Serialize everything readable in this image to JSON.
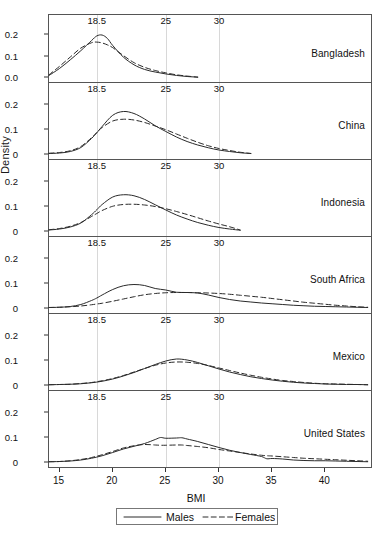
{
  "figure": {
    "ylabel": "Density",
    "xlabel": "BMI"
  },
  "legend": {
    "males_label": "Males",
    "females_label": "Females"
  },
  "chart_data": {
    "type": "line",
    "title": "",
    "xlabel": "BMI",
    "ylabel": "Density",
    "xlim": [
      14,
      44.5
    ],
    "ylim": [
      0,
      0.22
    ],
    "grid": "vertical reference lines at BMI 18.5, 25, 30 (labeled at top of each panel)",
    "legend_position": "bottom-center, boxed",
    "xticks": [
      15,
      20,
      25,
      30,
      35,
      40
    ],
    "xtick_labels": [
      "15",
      "20",
      "25",
      "30",
      "35",
      "40"
    ],
    "reference_lines": [
      18.5,
      25,
      30
    ],
    "reference_line_labels": [
      "18.5",
      "25",
      "30"
    ],
    "series_names": [
      "Males",
      "Females"
    ],
    "series_styles": [
      "solid",
      "dashed"
    ],
    "panels": [
      {
        "name": "Bangladesh",
        "yticks": [
          0,
          0.1,
          0.2
        ],
        "ytick_labels": [
          "0.0",
          "0.1",
          "0.2"
        ],
        "x": [
          14,
          15,
          16,
          17,
          18,
          18.5,
          19,
          19.5,
          20,
          21,
          22,
          23,
          24,
          25,
          26,
          27,
          28
        ],
        "series": [
          {
            "name": "Males",
            "values": [
              0.012,
              0.045,
              0.085,
              0.128,
              0.175,
              0.197,
              0.201,
              0.185,
              0.152,
              0.098,
              0.062,
              0.04,
              0.028,
              0.019,
              0.012,
              0.007,
              0.004
            ]
          },
          {
            "name": "Females",
            "values": [
              0.015,
              0.055,
              0.098,
              0.14,
              0.165,
              0.168,
              0.164,
              0.155,
              0.142,
              0.105,
              0.072,
              0.05,
              0.035,
              0.024,
              0.015,
              0.009,
              0.004
            ]
          }
        ]
      },
      {
        "name": "China",
        "yticks": [
          0,
          0.1,
          0.2
        ],
        "ytick_labels": [
          "0",
          "0.1",
          "0.2"
        ],
        "x": [
          14,
          15,
          16,
          17,
          18,
          18.5,
          19,
          20,
          21,
          22,
          23,
          24,
          25,
          26,
          27,
          28,
          29,
          30,
          31,
          32,
          33
        ],
        "series": [
          {
            "name": "Males",
            "values": [
              0.002,
              0.004,
              0.01,
              0.026,
              0.062,
              0.085,
              0.11,
              0.155,
              0.17,
              0.162,
              0.14,
              0.113,
              0.09,
              0.068,
              0.05,
              0.036,
              0.025,
              0.016,
              0.01,
              0.005,
              0.002
            ]
          },
          {
            "name": "Females",
            "values": [
              0.003,
              0.006,
              0.013,
              0.03,
              0.065,
              0.086,
              0.106,
              0.132,
              0.139,
              0.136,
              0.126,
              0.112,
              0.097,
              0.08,
              0.063,
              0.047,
              0.033,
              0.022,
              0.014,
              0.007,
              0.002
            ]
          }
        ]
      },
      {
        "name": "Indonesia",
        "yticks": [
          0,
          0.1,
          0.2
        ],
        "ytick_labels": [
          "0",
          "0.1",
          "0.2"
        ],
        "x": [
          14,
          15,
          16,
          17,
          18,
          18.5,
          19,
          20,
          21,
          22,
          23,
          24,
          25,
          26,
          27,
          28,
          29,
          30,
          31,
          32
        ],
        "series": [
          {
            "name": "Males",
            "values": [
              0.004,
              0.008,
              0.016,
              0.032,
              0.065,
              0.085,
              0.106,
              0.136,
              0.145,
              0.141,
              0.126,
              0.105,
              0.084,
              0.064,
              0.048,
              0.034,
              0.023,
              0.014,
              0.008,
              0.003
            ]
          },
          {
            "name": "Females",
            "values": [
              0.005,
              0.01,
              0.019,
              0.034,
              0.058,
              0.07,
              0.082,
              0.099,
              0.106,
              0.107,
              0.104,
              0.098,
              0.089,
              0.078,
              0.066,
              0.053,
              0.04,
              0.028,
              0.017,
              0.004
            ]
          }
        ]
      },
      {
        "name": "South Africa",
        "yticks": [
          0,
          0.1,
          0.2
        ],
        "ytick_labels": [
          "0",
          "0.1",
          "0.2"
        ],
        "x": [
          14,
          15,
          16,
          17,
          18,
          18.5,
          19,
          20,
          21,
          22,
          23,
          24,
          25,
          26,
          27,
          28,
          29,
          30,
          31,
          32,
          33,
          34,
          35,
          36,
          37,
          38,
          39,
          40,
          41,
          42,
          43,
          44
        ],
        "series": [
          {
            "name": "Males",
            "values": [
              0.002,
              0.003,
              0.006,
              0.014,
              0.03,
              0.04,
              0.052,
              0.074,
              0.089,
              0.094,
              0.09,
              0.078,
              0.072,
              0.063,
              0.062,
              0.06,
              0.052,
              0.042,
              0.034,
              0.028,
              0.024,
              0.02,
              0.017,
              0.014,
              0.011,
              0.009,
              0.007,
              0.006,
              0.005,
              0.004,
              0.003,
              0.002
            ]
          },
          {
            "name": "Females",
            "values": [
              0.002,
              0.003,
              0.005,
              0.008,
              0.013,
              0.016,
              0.019,
              0.027,
              0.036,
              0.045,
              0.053,
              0.058,
              0.061,
              0.062,
              0.062,
              0.061,
              0.06,
              0.058,
              0.055,
              0.051,
              0.047,
              0.043,
              0.038,
              0.033,
              0.028,
              0.023,
              0.019,
              0.015,
              0.011,
              0.008,
              0.005,
              0.003
            ]
          }
        ]
      },
      {
        "name": "Mexico",
        "yticks": [
          0,
          0.1,
          0.2
        ],
        "ytick_labels": [
          "0",
          "0.1",
          "0.2"
        ],
        "x": [
          14,
          15,
          16,
          17,
          18,
          19,
          20,
          21,
          22,
          23,
          24,
          25,
          26,
          27,
          28,
          29,
          30,
          31,
          32,
          33,
          34,
          35,
          36,
          37,
          38,
          39,
          40,
          41,
          42,
          43,
          44
        ],
        "series": [
          {
            "name": "Males",
            "values": [
              0.001,
              0.002,
              0.003,
              0.005,
              0.009,
              0.015,
              0.024,
              0.036,
              0.05,
              0.066,
              0.082,
              0.096,
              0.104,
              0.1,
              0.09,
              0.077,
              0.064,
              0.052,
              0.042,
              0.033,
              0.026,
              0.02,
              0.015,
              0.011,
              0.008,
              0.006,
              0.004,
              0.003,
              0.002,
              0.002,
              0.001
            ]
          },
          {
            "name": "Females",
            "values": [
              0.001,
              0.002,
              0.003,
              0.006,
              0.01,
              0.017,
              0.026,
              0.038,
              0.052,
              0.066,
              0.079,
              0.088,
              0.092,
              0.091,
              0.086,
              0.078,
              0.068,
              0.058,
              0.048,
              0.039,
              0.031,
              0.024,
              0.018,
              0.014,
              0.01,
              0.007,
              0.005,
              0.004,
              0.003,
              0.002,
              0.001
            ]
          }
        ]
      },
      {
        "name": "United States",
        "yticks": [
          0,
          0.1,
          0.2
        ],
        "ytick_labels": [
          "0",
          "0.1",
          "0.2"
        ],
        "x": [
          14,
          15,
          16,
          17,
          18,
          19,
          20,
          21,
          22,
          23,
          24,
          24.5,
          25,
          26,
          26.5,
          27,
          28,
          29,
          30,
          31,
          32,
          33,
          34,
          34.5,
          35,
          36,
          37,
          38,
          39,
          40,
          41,
          42,
          43,
          44
        ],
        "series": [
          {
            "name": "Males",
            "values": [
              0.001,
              0.002,
              0.004,
              0.008,
              0.015,
              0.025,
              0.038,
              0.052,
              0.063,
              0.074,
              0.09,
              0.098,
              0.095,
              0.096,
              0.097,
              0.092,
              0.082,
              0.07,
              0.058,
              0.047,
              0.038,
              0.03,
              0.022,
              0.013,
              0.014,
              0.012,
              0.008,
              0.006,
              0.005,
              0.005,
              0.004,
              0.003,
              0.002,
              0.001
            ]
          },
          {
            "name": "Females",
            "values": [
              0.001,
              0.002,
              0.005,
              0.01,
              0.018,
              0.029,
              0.042,
              0.056,
              0.065,
              0.07,
              0.068,
              0.067,
              0.067,
              0.068,
              0.068,
              0.066,
              0.062,
              0.057,
              0.05,
              0.044,
              0.038,
              0.032,
              0.027,
              0.025,
              0.024,
              0.021,
              0.018,
              0.015,
              0.013,
              0.011,
              0.009,
              0.007,
              0.005,
              0.003
            ]
          }
        ]
      }
    ]
  }
}
